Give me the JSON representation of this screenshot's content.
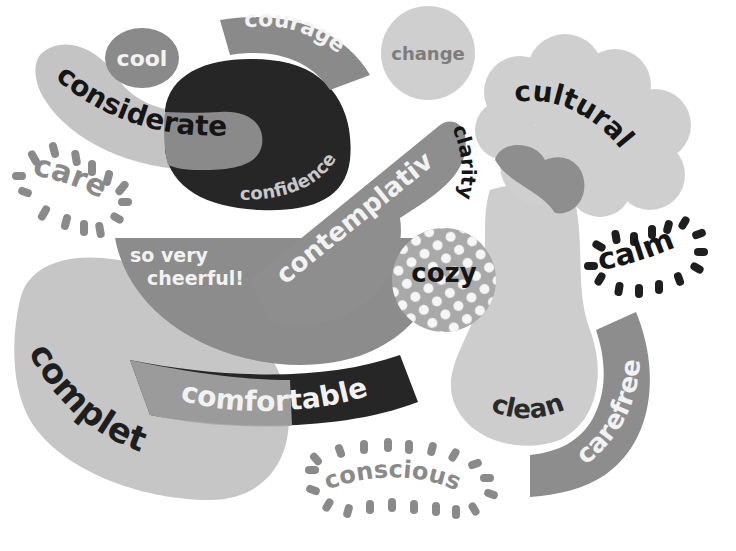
{
  "colors": {
    "background": "#ffffff",
    "light": "#c9c9c9",
    "lighter": "#d4d4d4",
    "mid": "#8a8a8a",
    "midlight": "#a5a5a5",
    "dark": "#262626",
    "white_text": "#f2f2f2",
    "black_text": "#151515",
    "grey_text": "#7d7d7d"
  },
  "words": {
    "cool": "cool",
    "courage": "courage",
    "change": "change",
    "considerate": "considerate",
    "confidence": "confidence",
    "care": "care",
    "cultural": "cultural",
    "clarity": "clarity",
    "contemplative": "contemplative",
    "so_very": "so very",
    "cheerful": "cheerful!",
    "cozy": "cozy",
    "calm": "calm",
    "complete": "complete",
    "comfortable": "comfortable",
    "clean": "clean",
    "carefree": "carefree",
    "conscious": "conscious"
  }
}
